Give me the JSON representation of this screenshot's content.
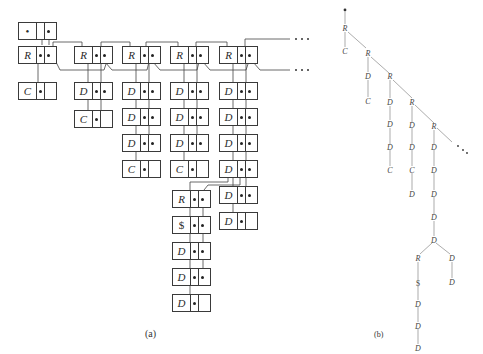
{
  "figure": {
    "panel_a": {
      "caption": "(a)",
      "root_node": {
        "label": "•"
      },
      "columns": [
        {
          "nodes": [
            "R",
            "C"
          ]
        },
        {
          "nodes": [
            "R",
            "D",
            "C"
          ]
        },
        {
          "nodes": [
            "R",
            "D",
            "D",
            "D",
            "C"
          ]
        },
        {
          "nodes": [
            "R",
            "D",
            "D",
            "D",
            "C",
            "R",
            "$",
            "D",
            "D",
            "D"
          ]
        },
        {
          "nodes": [
            "R",
            "D",
            "D",
            "D",
            "D",
            "D",
            "D"
          ]
        }
      ],
      "continuation_markers": [
        "• • •",
        "• • •"
      ]
    },
    "panel_b": {
      "caption": "(b)",
      "root": "•",
      "continuation_marker": "• • •",
      "tree_labels": [
        "R",
        "C",
        "R",
        "D",
        "C",
        "R",
        "D",
        "D",
        "C",
        "R",
        "D",
        "D",
        "D",
        "C",
        "D",
        "D",
        "D",
        "D",
        "R",
        "D",
        "$",
        "D",
        "D",
        "D",
        "D"
      ]
    }
  }
}
